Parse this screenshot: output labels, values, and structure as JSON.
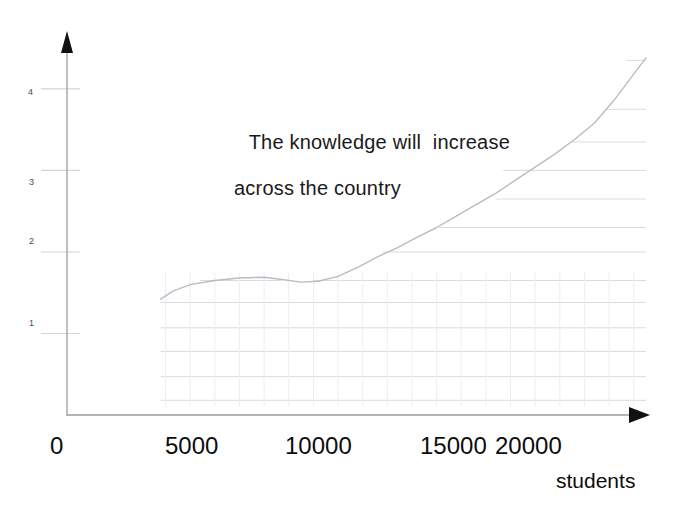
{
  "chart_data": {
    "type": "line",
    "title": "The knowledge will  increase across the country",
    "title_line1": "The knowledge will  increase",
    "title_line2": "across the country",
    "xlabel": "students",
    "ylabel": "",
    "xlim": [
      0,
      23500
    ],
    "ylim": [
      0,
      4.6
    ],
    "grid": true,
    "legend": "none",
    "xtick_labels": [
      "0",
      "5000",
      "10000",
      "15000",
      "20000"
    ],
    "xtick_values": [
      0,
      5000,
      10000,
      15000,
      20000
    ],
    "ytick_labels": [
      "1",
      "2",
      "3",
      "4"
    ],
    "ytick_values": [
      1,
      2,
      3,
      4
    ],
    "series": [
      {
        "name": "knowledge",
        "x": [
          3800,
          4300,
          5000,
          6000,
          7000,
          8000,
          8800,
          9500,
          10200,
          11000,
          11800,
          12600,
          13400,
          14200,
          15000,
          15800,
          16600,
          17400,
          18200,
          19000,
          19800,
          20600,
          21400,
          22200,
          23000,
          23500
        ],
        "y": [
          1.42,
          1.52,
          1.6,
          1.65,
          1.68,
          1.69,
          1.66,
          1.63,
          1.64,
          1.7,
          1.81,
          1.94,
          2.05,
          2.18,
          2.3,
          2.44,
          2.58,
          2.72,
          2.88,
          3.04,
          3.2,
          3.38,
          3.58,
          3.86,
          4.18,
          4.38
        ]
      }
    ],
    "grid_steps": [
      {
        "y": 1.65,
        "x_start": 5400,
        "x_end": 8700
      },
      {
        "y": 1.65,
        "x_start": 10000,
        "x_end": 23500
      },
      {
        "y": 2.0,
        "x_start": 12800,
        "x_end": 23500
      },
      {
        "y": 2.3,
        "x_start": 15100,
        "x_end": 23500
      },
      {
        "y": 2.65,
        "x_start": 17400,
        "x_end": 23500
      },
      {
        "y": 3.0,
        "x_start": 17700,
        "x_end": 23500
      },
      {
        "y": 3.35,
        "x_start": 20500,
        "x_end": 23500
      },
      {
        "y": 3.75,
        "x_start": 21900,
        "x_end": 23500
      },
      {
        "y": 4.35,
        "x_start": 22700,
        "x_end": 23500
      }
    ],
    "grid_full_rows": [
      1.38,
      1.07,
      0.78,
      0.47,
      0.18
    ],
    "colors": {
      "axis": "#111111",
      "curve": "#b9bcc4",
      "grid": "#d9dbe0",
      "text": "#111111",
      "background": "#ffffff"
    }
  }
}
